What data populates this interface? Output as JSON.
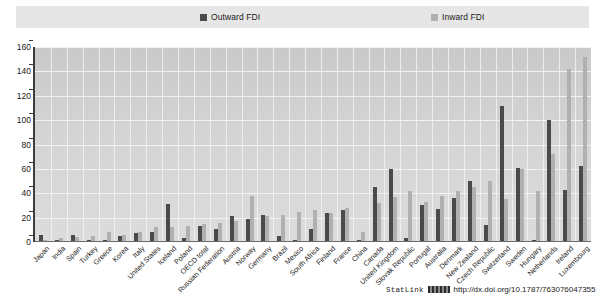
{
  "legend": {
    "entries": [
      {
        "label": "Outward FDI",
        "color": "#4a4a4a",
        "key": "outward"
      },
      {
        "label": "Inward FDI",
        "color": "#b0b0b0",
        "key": "inward"
      }
    ]
  },
  "footer": {
    "statlink_label": "StatLink",
    "statlink_url": "http://dx.doi.org/10.1787/763076047355"
  },
  "chart_data": {
    "type": "bar",
    "title": "",
    "subtitle": "",
    "xlabel": "",
    "ylabel": "",
    "ylim": [
      0,
      160
    ],
    "yticks": [
      0,
      20,
      40,
      60,
      80,
      100,
      120,
      140,
      160
    ],
    "grid": true,
    "legend_position": "top",
    "categories": [
      "Japan",
      "India",
      "Spain",
      "Turkey",
      "Greece",
      "Korea",
      "Italy",
      "United States",
      "Iceland",
      "Poland",
      "OECD total",
      "Russian Federation",
      "Austria",
      "Norway",
      "Germany",
      "Brazil",
      "Mexico",
      "South Africa",
      "Finland",
      "France",
      "China",
      "Canada",
      "United Kingdom",
      "Slovak Republic",
      "Portugal",
      "Australia",
      "Denmark",
      "New Zealand",
      "Czech Republic",
      "Switzerland",
      "Sweden",
      "Hungary",
      "Netherlands",
      "Ireland",
      "Luxembourg"
    ],
    "series": [
      {
        "name": "Outward FDI",
        "color": "#4a4a4a",
        "values": [
          6,
          2,
          6,
          2,
          2,
          5,
          7,
          8,
          31,
          3,
          13,
          11,
          21,
          19,
          22,
          5,
          2,
          11,
          24,
          26,
          2,
          45,
          60,
          3,
          30,
          27,
          36,
          50,
          14,
          112,
          61,
          2,
          100,
          43,
          62
        ]
      },
      {
        "name": "Inward FDI",
        "color": "#b0b0b0",
        "values": [
          2,
          3,
          4,
          5,
          8,
          6,
          8,
          12,
          12,
          13,
          15,
          16,
          17,
          38,
          21,
          22,
          25,
          26,
          24,
          28,
          8,
          32,
          37,
          42,
          33,
          38,
          42,
          45,
          50,
          35,
          60,
          42,
          72,
          142,
          152
        ]
      }
    ]
  }
}
